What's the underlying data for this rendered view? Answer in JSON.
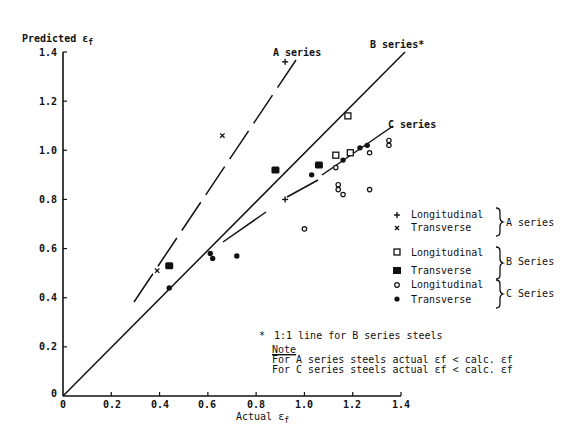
{
  "chart_data": {
    "type": "scatter",
    "title": "",
    "xlabel": "Actual εf",
    "ylabel": "Predicted εf",
    "xlim": [
      0,
      1.4
    ],
    "ylim": [
      0,
      1.4
    ],
    "x_ticks": [
      "0",
      "0.2",
      "0.4",
      "0.6",
      "0.8",
      "1.0",
      "1.2",
      "1.4"
    ],
    "y_ticks": [
      "0",
      "0.2",
      "0.4",
      "0.6",
      "0.8",
      "1.0",
      "1.2",
      "1.4"
    ],
    "grid": false,
    "series": [
      {
        "name": "A series Longitudinal",
        "marker": "plus",
        "points": [
          [
            0.92,
            0.8
          ],
          [
            0.92,
            1.36
          ]
        ]
      },
      {
        "name": "A series Transverse",
        "marker": "cross",
        "points": [
          [
            0.39,
            0.51
          ],
          [
            0.66,
            1.06
          ]
        ]
      },
      {
        "name": "B series Longitudinal",
        "marker": "open-square",
        "points": [
          [
            1.18,
            1.14
          ],
          [
            1.13,
            0.98
          ],
          [
            1.19,
            0.99
          ]
        ]
      },
      {
        "name": "B series Transverse",
        "marker": "filled-square",
        "points": [
          [
            0.44,
            0.53
          ],
          [
            0.88,
            0.92
          ],
          [
            1.06,
            0.94
          ]
        ]
      },
      {
        "name": "C series Longitudinal",
        "marker": "open-circle",
        "points": [
          [
            1.13,
            0.93
          ],
          [
            1.27,
            0.99
          ],
          [
            1.14,
            0.86
          ],
          [
            1.14,
            0.84
          ],
          [
            1.16,
            0.82
          ],
          [
            1.27,
            0.84
          ],
          [
            1.0,
            0.68
          ],
          [
            1.35,
            1.02
          ],
          [
            1.35,
            1.04
          ]
        ]
      },
      {
        "name": "C series Transverse",
        "marker": "filled-circle",
        "points": [
          [
            0.44,
            0.44
          ],
          [
            0.61,
            0.58
          ],
          [
            0.62,
            0.56
          ],
          [
            0.72,
            0.57
          ],
          [
            1.03,
            0.9
          ],
          [
            1.16,
            0.96
          ],
          [
            1.23,
            1.01
          ],
          [
            1.26,
            1.02
          ]
        ]
      }
    ],
    "lines": [
      {
        "name": "A series",
        "style": "dashed",
        "from": [
          0.29,
          0.38
        ],
        "to": [
          0.96,
          1.37
        ]
      },
      {
        "name": "B series*",
        "style": "solid",
        "from": [
          0,
          0
        ],
        "to": [
          1.42,
          1.4
        ]
      },
      {
        "name": "C series",
        "style": "solid-broken",
        "from": [
          0.66,
          0.63
        ],
        "to": [
          1.37,
          1.1
        ]
      }
    ],
    "annotations": [
      "A series",
      "B series*",
      "C series",
      "* 1:1 line for B series steels",
      "Note",
      "For A series steels actual εf < calc. εf",
      "For C series steels actual εf < calc. εf"
    ],
    "legend_position": "right"
  },
  "axes": {
    "y_title": "Predicted ε",
    "y_title_sub": "f",
    "x_title": "Actual ε",
    "x_title_sub": "f",
    "origin_label": "0",
    "x_ticks": [
      "0",
      "0.2",
      "0.4",
      "0.6",
      "0.8",
      "1.0",
      "1.2",
      "1.4"
    ],
    "y_ticks": [
      "0.2",
      "0.4",
      "0.6",
      "0.8",
      "1.0",
      "1.2",
      "1.4"
    ]
  },
  "line_labels": {
    "a": "A series",
    "b": "B series*",
    "c": "C series"
  },
  "legend": {
    "a_long": "Longitudinal",
    "a_trans": "Transverse",
    "a_group": "A series",
    "b_long": "Longitudinal",
    "b_trans": "Transverse",
    "b_group": "B Series",
    "c_long": "Longitudinal",
    "c_trans": "Transverse",
    "c_group": "C Series"
  },
  "notes": {
    "footnote_mark": "*",
    "footnote": "1:1 line for B series steels",
    "note_title": "Note",
    "line1": "For A series steels actual εf < calc. εf",
    "line2": "For C series steels actual εf < calc. εf"
  }
}
